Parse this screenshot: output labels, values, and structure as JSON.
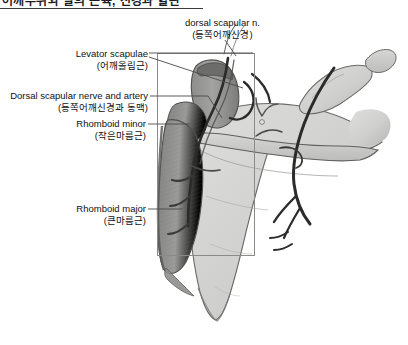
{
  "figure": {
    "width": 408,
    "height": 345,
    "background": "#ffffff"
  },
  "header": {
    "text": "어깨부위와 팔의 근육, 신경과 혈관",
    "clipped": true,
    "rule_color": "#3a3a3a"
  },
  "labels": [
    {
      "id": "dorsal-scapular-nerve",
      "english": "dorsal scapular n.",
      "korean": "(등쪽어깨신경)",
      "align": "center",
      "x": 185,
      "y": 17
    },
    {
      "id": "levator-scapulae",
      "english": "Levator scapulae",
      "korean": "(어깨올림근)",
      "align": "right",
      "x": 68,
      "y": 48
    },
    {
      "id": "dorsal-scapular-nerve-and-artery",
      "english": "Dorsal scapular nerve and artery",
      "korean": "(등쪽어깨신경과 동맥)",
      "align": "right",
      "x": 10,
      "y": 88
    },
    {
      "id": "rhomboid-minor",
      "english": "Rhomboid minor",
      "korean": "(작은마름근)",
      "align": "right",
      "x": 67,
      "y": 118
    },
    {
      "id": "rhomboid-major",
      "english": "Rhomboid major",
      "korean": "(큰마름근)",
      "align": "right",
      "x": 68,
      "y": 200
    }
  ],
  "highlight_rect": {
    "x": 157,
    "y": 53,
    "width": 98,
    "height": 203,
    "stroke": "#8a8a8a"
  },
  "palette": {
    "bone_light": "#d8d8d6",
    "bone_mid": "#c2c2c0",
    "bone_shadow": "#a9a9a7",
    "muscle_dark": "#7e7e7c",
    "muscle_mid": "#9a9a98",
    "vessel_dark": "#2b2b2b",
    "outline": "#555555",
    "leader": "#4a4a4a",
    "text": "#111111"
  }
}
